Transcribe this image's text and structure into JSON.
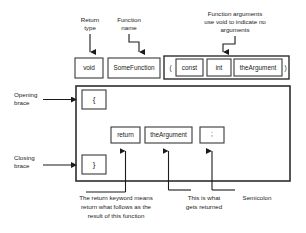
{
  "diagram": {
    "colors": {
      "background": "#ffffff",
      "box_stroke": "#3a3a3a",
      "outer_stroke": "#2e2e2e",
      "text": "#1b1b1b",
      "connector": "#1b1b1b"
    },
    "annotations": {
      "return_type": "Return\ntype",
      "return_type_line1": "Return",
      "return_type_line2": "type",
      "function_name_line1": "Function",
      "function_name_line2": "name",
      "function_arguments_line1": "Function arguments",
      "function_arguments_line2": "use void to indicate no",
      "function_arguments_line3": "arguments",
      "opening_brace_line1": "Opening",
      "opening_brace_line2": "brace",
      "closing_brace_line1": "Closing",
      "closing_brace_line2": "brace",
      "return_keyword_line1": "The return keyword means",
      "return_keyword_line2": "return what follows as the",
      "return_keyword_line3": "result of this function",
      "returned_value_line1": "This is what",
      "returned_value_line2": "gets returned",
      "semicolon": "Semicolon"
    },
    "signature": {
      "return_type_token": "void",
      "function_name_token": "SomeFunction",
      "paren_open_token": "(",
      "const_token": "const",
      "int_token": "int",
      "argument_token": "theArgument",
      "paren_close_token": ")"
    },
    "body": {
      "opening_brace_token": "{",
      "return_token": "return",
      "argument_token": "theArgument",
      "semicolon_token": ";",
      "closing_brace_token": "}"
    }
  }
}
